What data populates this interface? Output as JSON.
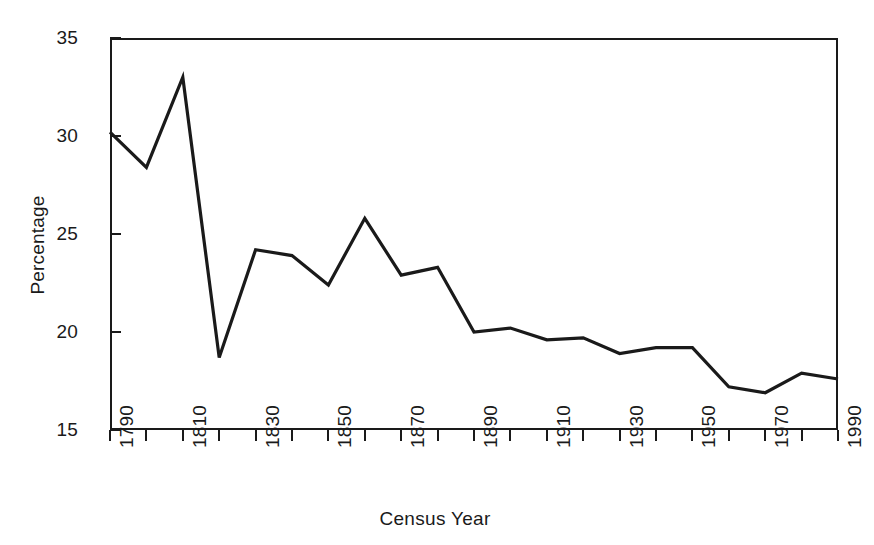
{
  "chart_data": {
    "type": "line",
    "title": "",
    "xlabel": "Census Year",
    "ylabel": "Percentage",
    "xlim": [
      1790,
      1990
    ],
    "ylim": [
      15,
      35
    ],
    "grid": false,
    "legend": "none",
    "x_tick_interval": 10,
    "x_label_interval": 20,
    "y_tick_interval": 5,
    "line_color": "#1a1a1a",
    "x": [
      1790,
      1800,
      1810,
      1820,
      1830,
      1840,
      1850,
      1860,
      1870,
      1880,
      1890,
      1900,
      1910,
      1920,
      1930,
      1940,
      1950,
      1960,
      1970,
      1980,
      1990
    ],
    "values": [
      30.2,
      28.4,
      33.0,
      18.7,
      24.2,
      23.9,
      22.4,
      25.8,
      22.9,
      23.3,
      20.0,
      20.2,
      19.6,
      19.7,
      18.9,
      19.2,
      19.2,
      17.2,
      16.9,
      17.9,
      17.6
    ],
    "x_tick_labels": [
      "1790",
      "1810",
      "1830",
      "1850",
      "1870",
      "1890",
      "1910",
      "1930",
      "1950",
      "1970",
      "1990"
    ],
    "x_tick_label_values": [
      1790,
      1810,
      1830,
      1850,
      1870,
      1890,
      1910,
      1930,
      1950,
      1970,
      1990
    ],
    "y_tick_labels": [
      "35",
      "30",
      "25",
      "20",
      "15"
    ],
    "y_tick_label_values": [
      35,
      30,
      25,
      20,
      15
    ]
  }
}
